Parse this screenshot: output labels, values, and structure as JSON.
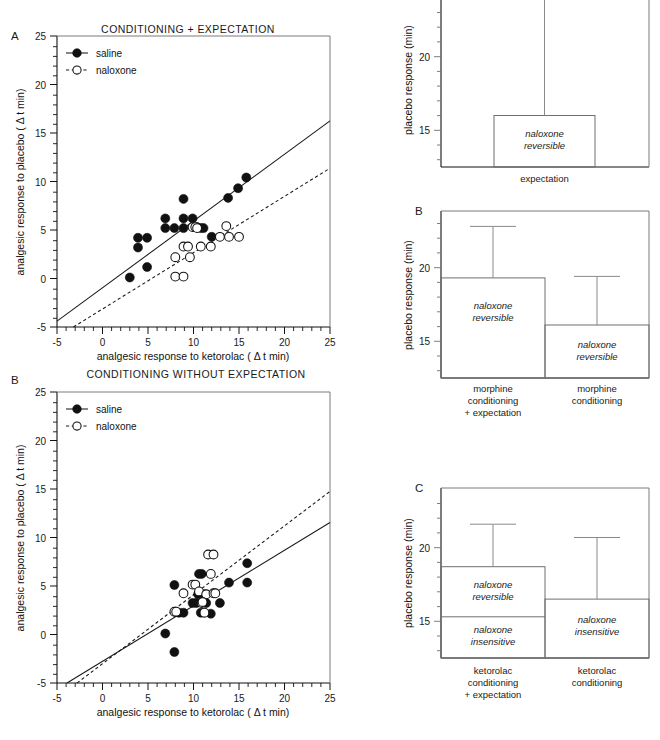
{
  "figure": {
    "scatter_panels": [
      {
        "letter": "A",
        "title": "CONDITIONING + EXPECTATION",
        "xlabel": "analgesic response to ketorolac ( Δ t min)",
        "ylabel": "analgesic response to placebo ( Δ t min)",
        "xticks": [
          -5,
          0,
          5,
          10,
          15,
          20,
          25
        ],
        "yticks": [
          -5,
          0,
          5,
          10,
          15,
          20,
          25
        ],
        "xlim": [
          -5,
          25
        ],
        "ylim": [
          -5,
          25
        ],
        "legend": [
          {
            "label": "saline",
            "marker": "filled-circle",
            "line": "solid"
          },
          {
            "label": "naloxone",
            "marker": "open-circle",
            "line": "dashed"
          }
        ],
        "series": [
          {
            "name": "saline",
            "marker": "filled-circle",
            "points": [
              [
                3.0,
                0.1
              ],
              [
                3.9,
                4.2
              ],
              [
                3.9,
                3.2
              ],
              [
                4.9,
                4.2
              ],
              [
                4.9,
                1.2
              ],
              [
                6.9,
                6.2
              ],
              [
                6.9,
                5.2
              ],
              [
                7.9,
                5.2
              ],
              [
                8.9,
                8.2
              ],
              [
                8.9,
                6.2
              ],
              [
                8.9,
                5.2
              ],
              [
                9.9,
                6.2
              ],
              [
                10.4,
                5.3
              ],
              [
                10.8,
                5.2
              ],
              [
                11.1,
                5.2
              ],
              [
                12.0,
                4.3
              ],
              [
                13.8,
                8.3
              ],
              [
                14.9,
                9.3
              ],
              [
                15.8,
                10.4
              ]
            ],
            "fit": {
              "x": [
                -5,
                25
              ],
              "y": [
                -4.4,
                16.3
              ],
              "style": "solid"
            }
          },
          {
            "name": "naloxone",
            "marker": "open-circle",
            "points": [
              [
                8.0,
                2.2
              ],
              [
                8.0,
                0.2
              ],
              [
                8.9,
                0.2
              ],
              [
                8.9,
                3.3
              ],
              [
                9.4,
                3.3
              ],
              [
                9.6,
                2.2
              ],
              [
                9.9,
                5.3
              ],
              [
                10.2,
                5.3
              ],
              [
                10.4,
                5.2
              ],
              [
                10.8,
                3.3
              ],
              [
                11.9,
                3.3
              ],
              [
                12.9,
                4.3
              ],
              [
                13.6,
                5.4
              ],
              [
                13.9,
                4.3
              ],
              [
                15.0,
                4.3
              ]
            ],
            "fit": {
              "x": [
                -3.2,
                25
              ],
              "y": [
                -5.0,
                11.4
              ],
              "style": "dashed"
            }
          }
        ]
      },
      {
        "letter": "B",
        "title": "CONDITIONING WITHOUT EXPECTATION",
        "xlabel": "analgesic response to ketorolac ( Δ t min)",
        "ylabel": "analgesic response to placebo ( Δ t min)",
        "xticks": [
          -5,
          0,
          5,
          10,
          15,
          20,
          25
        ],
        "yticks": [
          -5,
          0,
          5,
          10,
          15,
          20,
          25
        ],
        "xlim": [
          -5,
          25
        ],
        "ylim": [
          -5,
          25
        ],
        "legend": [
          {
            "label": "saline",
            "marker": "filled-circle",
            "line": "solid"
          },
          {
            "label": "naloxone",
            "marker": "open-circle",
            "line": "dashed"
          }
        ],
        "series": [
          {
            "name": "saline",
            "marker": "filled-circle",
            "points": [
              [
                6.9,
                0.1
              ],
              [
                7.9,
                5.1
              ],
              [
                7.9,
                -1.8
              ],
              [
                8.0,
                2.2
              ],
              [
                8.4,
                2.1
              ],
              [
                8.9,
                2.1
              ],
              [
                9.9,
                3.1
              ],
              [
                10.3,
                3.1
              ],
              [
                10.6,
                6.1
              ],
              [
                10.9,
                6.1
              ],
              [
                10.5,
                4.2
              ],
              [
                10.8,
                2.1
              ],
              [
                11.2,
                4.2
              ],
              [
                11.4,
                3.1
              ],
              [
                11.9,
                2.0
              ],
              [
                12.9,
                3.1
              ],
              [
                13.9,
                5.2
              ],
              [
                15.9,
                5.2
              ],
              [
                15.9,
                7.2
              ]
            ],
            "fit": {
              "x": [
                -3.9,
                25
              ],
              "y": [
                -5.0,
                11.6
              ],
              "style": "solid"
            }
          },
          {
            "name": "naloxone",
            "marker": "open-circle",
            "points": [
              [
                7.9,
                2.2
              ],
              [
                8.1,
                2.2
              ],
              [
                8.9,
                4.1
              ],
              [
                9.9,
                5.0
              ],
              [
                10.2,
                5.0
              ],
              [
                10.6,
                4.3
              ],
              [
                10.9,
                3.1
              ],
              [
                11.2,
                2.1
              ],
              [
                11.4,
                4.2
              ],
              [
                11.6,
                8.3
              ],
              [
                12.2,
                8.3
              ],
              [
                11.9,
                6.1
              ],
              [
                12.2,
                4.1
              ],
              [
                12.4,
                4.1
              ],
              [
                11.0,
                3.2
              ]
            ],
            "fit": {
              "x": [
                -2.8,
                25
              ],
              "y": [
                -5.0,
                14.8
              ],
              "style": "dashed"
            }
          }
        ]
      }
    ],
    "bar_panels": [
      {
        "letter": "",
        "ylabel": "placebo response (min)",
        "yticks": [
          15,
          20
        ],
        "ylim": [
          13.4,
          24.2
        ],
        "bars": [
          {
            "category": "expectation",
            "value": 16.9,
            "error_top": 24.6,
            "segments": [
              {
                "label": "naloxone\nreversible",
                "from": 13.4,
                "to": 16.9
              }
            ]
          }
        ]
      },
      {
        "letter": "B",
        "ylabel": "placebo response (min)",
        "yticks": [
          15,
          20
        ],
        "ylim": [
          13.4,
          24.2
        ],
        "bars": [
          {
            "category": "morphine\nconditioning\n+ expectation",
            "value": 20.2,
            "error_top": 23.7,
            "segments": [
              {
                "label": "naloxone\nreversible",
                "from": 13.4,
                "to": 20.2
              }
            ]
          },
          {
            "category": "morphine\nconditioning",
            "value": 17.0,
            "error_top": 20.3,
            "segments": [
              {
                "label": "naloxone\nreversible",
                "from": 13.4,
                "to": 17.0
              }
            ]
          }
        ]
      },
      {
        "letter": "C",
        "ylabel": "placebo response (min)",
        "yticks": [
          15,
          20
        ],
        "ylim": [
          13.4,
          24.2
        ],
        "bars": [
          {
            "category": "ketorolac\nconditioning\n+ expectation",
            "value": 19.6,
            "error_top": 22.5,
            "segments": [
              {
                "label": "naloxone\nreversible",
                "from": 16.2,
                "to": 19.6
              },
              {
                "label": "naloxone\ninsensitive",
                "from": 13.4,
                "to": 16.2
              }
            ]
          },
          {
            "category": "ketorolac\nconditioning",
            "value": 17.4,
            "error_top": 21.6,
            "segments": [
              {
                "label": "naloxone\ninsensitive",
                "from": 13.4,
                "to": 17.4
              }
            ]
          }
        ]
      }
    ]
  }
}
